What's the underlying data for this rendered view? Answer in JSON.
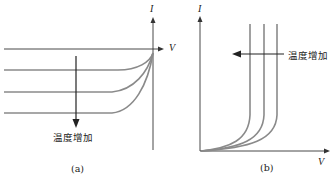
{
  "figure_a": {
    "caption": "(a)",
    "y_axis_label": "I",
    "x_axis_label": "V",
    "arrow_label": "温度增加",
    "curve_color": "#8a8a8a",
    "description": "Solar cell I-V curves shifting downward with increasing temperature"
  },
  "figure_b": {
    "caption": "(b)",
    "y_axis_label": "I",
    "x_axis_label": "V",
    "arrow_label": "温度增加",
    "curve_color": "#8a8a8a",
    "description": "Diode forward I-V curves shifting left with increasing temperature"
  }
}
